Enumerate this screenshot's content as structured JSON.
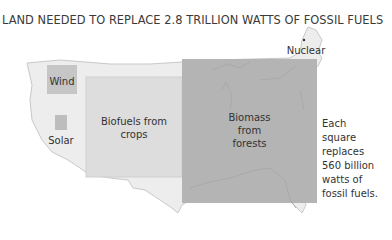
{
  "title": "LAND NEEDED TO REPLACE 2.8 TRILLION WATTS OF FOSSIL FUELS",
  "labels": {
    "wind": "Wind",
    "solar": "Solar",
    "biofuels_line1": "Biofuels from",
    "biofuels_line2": "crops",
    "biomass_line1": "Biomass",
    "biomass_line2": "from",
    "biomass_line3": "forests",
    "nuclear": "Nuclear"
  },
  "note": {
    "line1": "Each",
    "line2": "square",
    "line3": "replaces",
    "line4": "560 billion",
    "line5": "watts of",
    "line6": "fossil fuels."
  },
  "colors": {
    "map_fill": "#ededed",
    "map_stroke": "#c8c8c8",
    "wind_box": "#c6c6c6",
    "solar_box": "#bdbdbd",
    "biofuel_box": "#dddddd",
    "forest_box": "#b4b4b4"
  }
}
